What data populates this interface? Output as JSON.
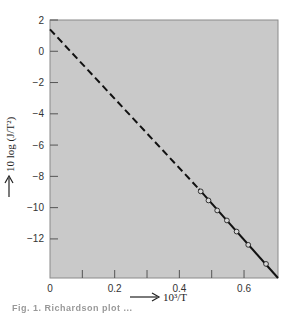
{
  "chart_data": {
    "type": "line",
    "title": "",
    "xlabel": "10³/T",
    "ylabel": "10 log (J/T²)",
    "xlim": [
      0,
      0.705
    ],
    "ylim": [
      -14.5,
      2
    ],
    "grid": false,
    "background": "#c9c9c9",
    "x_ticks": [
      0,
      0.2,
      0.4,
      0.6
    ],
    "x_tick_labels": [
      "0",
      "0.2",
      "0.4",
      "0.6"
    ],
    "x_minor_ticks": [
      0.1,
      0.3,
      0.5
    ],
    "y_ticks": [
      2,
      0,
      -2,
      -4,
      -6,
      -8,
      -10,
      -12
    ],
    "y_tick_labels": [
      "2",
      "0",
      "−2",
      "−4",
      "−6",
      "−8",
      "−10",
      "−12"
    ],
    "series": [
      {
        "name": "fit-line-extrapolated",
        "style": "dashed",
        "x": [
          0,
          0.46
        ],
        "y": [
          1.4,
          -8.8
        ]
      },
      {
        "name": "fit-line",
        "style": "solid",
        "x": [
          0.46,
          0.705
        ],
        "y": [
          -8.8,
          -14.5
        ]
      },
      {
        "name": "measurements",
        "style": "markers",
        "marker": "open-circle",
        "x": [
          0.466,
          0.49,
          0.517,
          0.547,
          0.577,
          0.613,
          0.668
        ],
        "y": [
          -8.96,
          -9.54,
          -10.18,
          -10.82,
          -11.53,
          -12.38,
          -13.6
        ]
      }
    ],
    "legend": null
  },
  "labels": {
    "x_axis": "10³/T",
    "y_axis": "10 log (J/T²)",
    "caption": "Fig. 1. Richardson plot ..."
  }
}
